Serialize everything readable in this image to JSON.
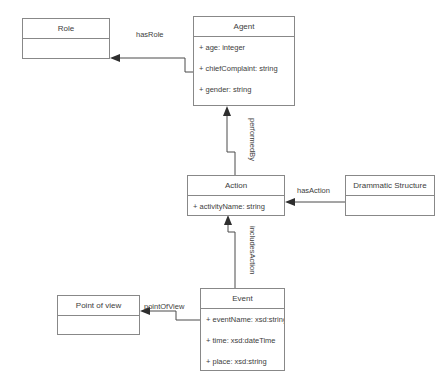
{
  "diagram": {
    "type": "uml-class-diagram",
    "background_color": "#ffffff",
    "line_color": "#4a4a4a",
    "text_color": "#3d3d3d",
    "classes": [
      {
        "id": "role",
        "name": "Role",
        "attributes": []
      },
      {
        "id": "agent",
        "name": "Agent",
        "attributes": [
          "+ age: integer",
          "+ chiefComplaint: string",
          "+ gender: string"
        ]
      },
      {
        "id": "action",
        "name": "Action",
        "attributes": [
          "+ activityName: string"
        ]
      },
      {
        "id": "drammatic_structure",
        "name": "Drammatic Structure",
        "attributes": []
      },
      {
        "id": "event",
        "name": "Event",
        "attributes": [
          "+ eventName: xsd:string",
          "+ time: xsd:dateTime",
          "+ place: xsd:string"
        ]
      },
      {
        "id": "point_of_view",
        "name": "Point of view",
        "attributes": []
      }
    ],
    "associations": [
      {
        "id": "has_role",
        "label": "hasRole",
        "from": "agent",
        "to": "role",
        "orientation": "horizontal"
      },
      {
        "id": "performed_by",
        "label": "performedBy",
        "from": "action",
        "to": "agent",
        "orientation": "vertical"
      },
      {
        "id": "has_action",
        "label": "hasAction",
        "from": "drammatic_structure",
        "to": "action",
        "orientation": "horizontal"
      },
      {
        "id": "includes_action",
        "label": "includesAction",
        "from": "event",
        "to": "action",
        "orientation": "vertical"
      },
      {
        "id": "point_of_view_assoc",
        "label": "pointOfView",
        "from": "event",
        "to": "point_of_view",
        "orientation": "horizontal"
      }
    ]
  }
}
